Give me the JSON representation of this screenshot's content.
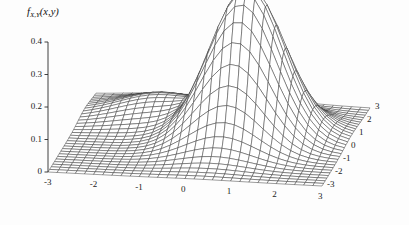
{
  "figure": {
    "kind": "surface-plot",
    "vertical_axis_title": "f",
    "vertical_axis_title_sub": "X,Y",
    "vertical_axis_title_args": "(x,y)",
    "background_color": "#fdfdfd",
    "mesh_color": "#3a3a3a",
    "axis_color": "#2b2b2b",
    "text_color": "#1a1a1a"
  },
  "chart_data": {
    "type": "surface",
    "title": "",
    "subtitle": "",
    "zlabel": "f_{X,Y}(x,y)",
    "xlabel": "",
    "ylabel": "",
    "grid": false,
    "legend": "none",
    "xlim": [
      -3,
      3
    ],
    "ylim": [
      -3,
      3
    ],
    "zlim": [
      0,
      0.47
    ],
    "x_ticks": [
      -3,
      -2,
      -1,
      0,
      1,
      2,
      3
    ],
    "x_tick_labels": [
      "-3",
      "-2",
      "-1",
      "0",
      "1",
      "2",
      "3"
    ],
    "y_ticks": [
      -3,
      -2,
      -1,
      0,
      1,
      2,
      3
    ],
    "y_tick_labels": [
      "-3",
      "-2",
      "-1",
      "0",
      "1",
      "2",
      "3"
    ],
    "z_ticks": [
      0,
      0.1,
      0.2,
      0.3,
      0.4
    ],
    "z_tick_labels": [
      "0",
      "0.1",
      "0.2",
      "0.3",
      "0.4"
    ],
    "surface": {
      "function": "bivariate-gaussian-mixture",
      "mesh_n": 31,
      "peak_value": 0.47,
      "peak_x": 0.8,
      "peak_y": 0.2,
      "components": [
        {
          "weight": 0.88,
          "mu_x": 0.8,
          "mu_y": 0.2,
          "sigma_x": 0.78,
          "sigma_y": 0.95,
          "rho": 0.18
        },
        {
          "weight": 0.12,
          "mu_x": -1.35,
          "mu_y": 1.6,
          "sigma_x": 0.9,
          "sigma_y": 0.8,
          "rho": 0.0
        }
      ]
    },
    "projection": {
      "origin_px": [
        48,
        172
      ],
      "x_corner_px": [
        322,
        186
      ],
      "y_corner_px": [
        96,
        94
      ],
      "z_unit_px_per_0_1": 32.5
    }
  }
}
